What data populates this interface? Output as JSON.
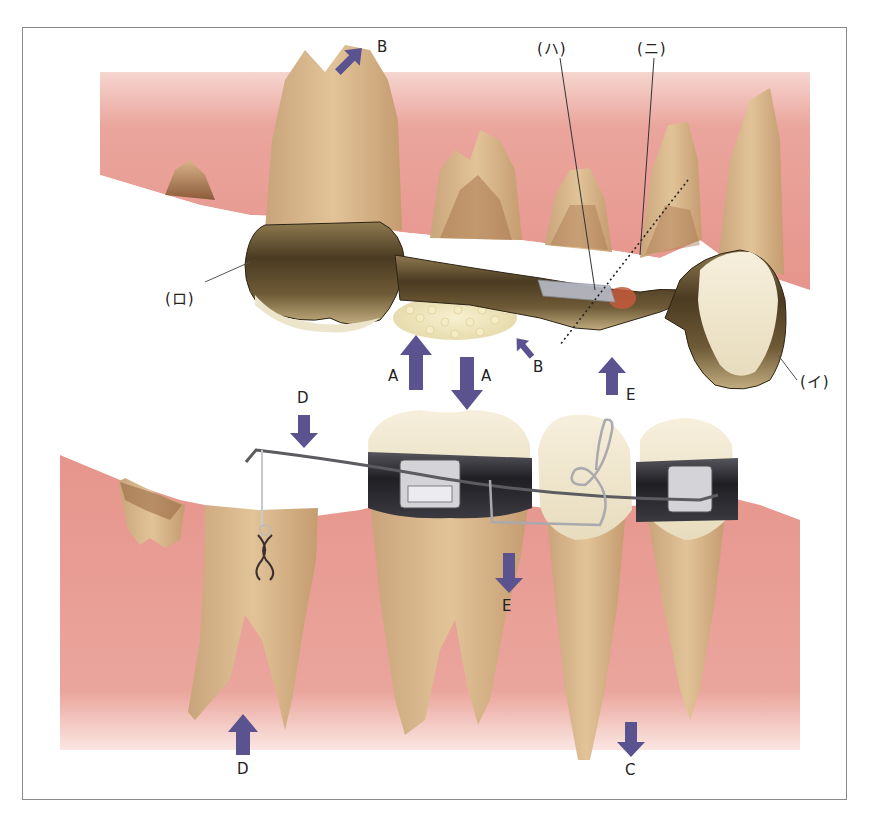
{
  "figure": {
    "colors": {
      "gum": "#e8a39b",
      "gum_light": "#f2c4bc",
      "tooth_root": "#dcb88e",
      "tooth_crown": "#f0e8d4",
      "metal_dark": "#3d3220",
      "metal_light": "#b9a47a",
      "arrow": "#5b5390",
      "band": "#2b2b30",
      "frame": "#8a8a8a"
    },
    "part_labels": {
      "i": "(イ)",
      "ro": "(ロ)",
      "ha": "(ハ)",
      "ni": "(ニ)"
    },
    "arrows": [
      {
        "id": "B-top",
        "label": "B",
        "direction": "up-right"
      },
      {
        "id": "A-up",
        "label": "A",
        "direction": "up"
      },
      {
        "id": "A-down",
        "label": "A",
        "direction": "down"
      },
      {
        "id": "B-mid",
        "label": "B",
        "direction": "up-left"
      },
      {
        "id": "E-up",
        "label": "E",
        "direction": "up"
      },
      {
        "id": "D-top",
        "label": "D",
        "direction": "down"
      },
      {
        "id": "E-down",
        "label": "E",
        "direction": "down"
      },
      {
        "id": "D-bottom",
        "label": "D",
        "direction": "up"
      },
      {
        "id": "C",
        "label": "C",
        "direction": "down"
      }
    ]
  }
}
